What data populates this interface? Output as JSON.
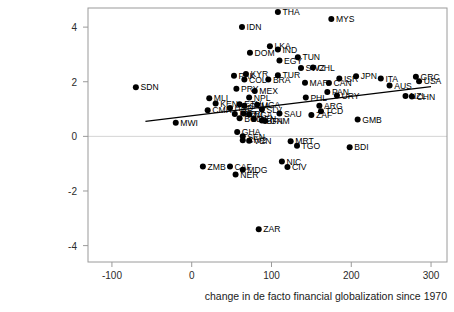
{
  "chart_data": {
    "type": "scatter",
    "title": "",
    "xlabel": "change in de facto financial globalization since 1970",
    "ylabel": "",
    "xlim": [
      -130,
      320
    ],
    "ylim": [
      -4.6,
      4.7
    ],
    "xticks": [
      -100,
      0,
      100,
      200,
      300
    ],
    "xticklabels": [
      "-100",
      "0",
      "100",
      "200",
      "300"
    ],
    "yticks": [
      -4,
      -2,
      0,
      2,
      4
    ],
    "yticklabels": [
      "-4",
      "-2",
      "0",
      "2",
      "4"
    ],
    "grid": false,
    "legend": null,
    "zero_line_y": 0,
    "fit_line": {
      "x0": -58,
      "y0": 0.55,
      "x1": 300,
      "y1": 1.82
    },
    "points": [
      {
        "label": "THA",
        "x": 108,
        "y": 4.55,
        "label_pos": "right"
      },
      {
        "label": "MYS",
        "x": 175,
        "y": 4.3,
        "label_pos": "right"
      },
      {
        "label": "IDN",
        "x": 63,
        "y": 4.0,
        "label_pos": "right"
      },
      {
        "label": "LKA",
        "x": 98,
        "y": 3.3,
        "label_pos": "right"
      },
      {
        "label": "IND",
        "x": 108,
        "y": 3.18,
        "label_pos": "right"
      },
      {
        "label": "DOM",
        "x": 73,
        "y": 3.06,
        "label_pos": "right"
      },
      {
        "label": "TUN",
        "x": 133,
        "y": 2.9,
        "label_pos": "right"
      },
      {
        "label": "EGY",
        "x": 110,
        "y": 2.78,
        "label_pos": "right"
      },
      {
        "label": "SWZ",
        "x": 137,
        "y": 2.5,
        "label_pos": "right"
      },
      {
        "label": "CHL",
        "x": 152,
        "y": 2.52,
        "label_pos": "right"
      },
      {
        "label": "TUR",
        "x": 108,
        "y": 2.24,
        "label_pos": "right"
      },
      {
        "label": "PAK",
        "x": 53,
        "y": 2.22,
        "label_pos": "right"
      },
      {
        "label": "KYR",
        "x": 68,
        "y": 2.28,
        "label_pos": "right"
      },
      {
        "label": "COL",
        "x": 66,
        "y": 2.08,
        "label_pos": "right"
      },
      {
        "label": "BRA",
        "x": 96,
        "y": 2.08,
        "label_pos": "right"
      },
      {
        "label": "MAR",
        "x": 142,
        "y": 1.96,
        "label_pos": "right"
      },
      {
        "label": "CAN",
        "x": 172,
        "y": 1.95,
        "label_pos": "right"
      },
      {
        "label": "ISR",
        "x": 185,
        "y": 2.12,
        "label_pos": "right"
      },
      {
        "label": "JPN",
        "x": 206,
        "y": 2.2,
        "label_pos": "right"
      },
      {
        "label": "ITA",
        "x": 237,
        "y": 2.12,
        "label_pos": "right"
      },
      {
        "label": "GRC",
        "x": 281,
        "y": 2.18,
        "label_pos": "right"
      },
      {
        "label": "USA",
        "x": 285,
        "y": 2.02,
        "label_pos": "right"
      },
      {
        "label": "AUS",
        "x": 248,
        "y": 1.86,
        "label_pos": "right"
      },
      {
        "label": "SDN",
        "x": -70,
        "y": 1.8,
        "label_pos": "right"
      },
      {
        "label": "PRY",
        "x": 56,
        "y": 1.74,
        "label_pos": "right"
      },
      {
        "label": "MEX",
        "x": 79,
        "y": 1.66,
        "label_pos": "right"
      },
      {
        "label": "PAN",
        "x": 170,
        "y": 1.62,
        "label_pos": "right"
      },
      {
        "label": "URY",
        "x": 182,
        "y": 1.5,
        "label_pos": "right"
      },
      {
        "label": "PHL",
        "x": 143,
        "y": 1.42,
        "label_pos": "right"
      },
      {
        "label": "NPL",
        "x": 72,
        "y": 1.42,
        "label_pos": "right"
      },
      {
        "label": "MLI",
        "x": 22,
        "y": 1.4,
        "label_pos": "right"
      },
      {
        "label": "NZL",
        "x": 268,
        "y": 1.48,
        "label_pos": "right"
      },
      {
        "label": "CHN",
        "x": 276,
        "y": 1.46,
        "label_pos": "right"
      },
      {
        "label": "KEN",
        "x": 30,
        "y": 1.2,
        "label_pos": "right"
      },
      {
        "label": "ETH",
        "x": 60,
        "y": 1.18,
        "label_pos": "right"
      },
      {
        "label": "UGA",
        "x": 82,
        "y": 1.16,
        "label_pos": "right"
      },
      {
        "label": "GTM",
        "x": 66,
        "y": 1.12,
        "label_pos": "right"
      },
      {
        "label": "ARG",
        "x": 160,
        "y": 1.12,
        "label_pos": "right"
      },
      {
        "label": "CMR",
        "x": 20,
        "y": 0.96,
        "label_pos": "right"
      },
      {
        "label": "HND",
        "x": 48,
        "y": 1.04,
        "label_pos": "right"
      },
      {
        "label": "SLV",
        "x": 88,
        "y": 0.98,
        "label_pos": "right"
      },
      {
        "label": "TCD",
        "x": 162,
        "y": 0.92,
        "label_pos": "right"
      },
      {
        "label": "PER",
        "x": 54,
        "y": 0.82,
        "label_pos": "right"
      },
      {
        "label": "CRI",
        "x": 65,
        "y": 0.84,
        "label_pos": "right"
      },
      {
        "label": "NGA",
        "x": 72,
        "y": 0.8,
        "label_pos": "right"
      },
      {
        "label": "SAU",
        "x": 110,
        "y": 0.84,
        "label_pos": "right"
      },
      {
        "label": "ZAF",
        "x": 150,
        "y": 0.78,
        "label_pos": "right"
      },
      {
        "label": "BGD",
        "x": 60,
        "y": 0.66,
        "label_pos": "right"
      },
      {
        "label": "BEN",
        "x": 78,
        "y": 0.64,
        "label_pos": "right"
      },
      {
        "label": "BFA",
        "x": 88,
        "y": 0.58,
        "label_pos": "right"
      },
      {
        "label": "GNM",
        "x": 92,
        "y": 0.56,
        "label_pos": "right"
      },
      {
        "label": "GMB",
        "x": 208,
        "y": 0.62,
        "label_pos": "right"
      },
      {
        "label": "MWI",
        "x": -20,
        "y": 0.5,
        "label_pos": "right"
      },
      {
        "label": "GHA",
        "x": 57,
        "y": 0.16,
        "label_pos": "right"
      },
      {
        "label": "SEN",
        "x": 64,
        "y": 0.0,
        "label_pos": "right"
      },
      {
        "label": "CIV2",
        "x": 64,
        "y": -0.14,
        "label_pos": "right"
      },
      {
        "label": "VEN",
        "x": 72,
        "y": -0.16,
        "label_pos": "right"
      },
      {
        "label": "MRT",
        "x": 124,
        "y": -0.18,
        "label_pos": "right"
      },
      {
        "label": "TGO",
        "x": 132,
        "y": -0.34,
        "label_pos": "right"
      },
      {
        "label": "BDI",
        "x": 198,
        "y": -0.4,
        "label_pos": "right"
      },
      {
        "label": "NIC",
        "x": 113,
        "y": -0.92,
        "label_pos": "right"
      },
      {
        "label": "CIV",
        "x": 120,
        "y": -1.12,
        "label_pos": "right"
      },
      {
        "label": "ZMB",
        "x": 14,
        "y": -1.1,
        "label_pos": "right"
      },
      {
        "label": "CAF",
        "x": 48,
        "y": -1.1,
        "label_pos": "right"
      },
      {
        "label": "MDG",
        "x": 64,
        "y": -1.22,
        "label_pos": "right"
      },
      {
        "label": "NER",
        "x": 55,
        "y": -1.4,
        "label_pos": "right"
      },
      {
        "label": "ZAR",
        "x": 84,
        "y": -3.4,
        "label_pos": "right"
      }
    ]
  }
}
